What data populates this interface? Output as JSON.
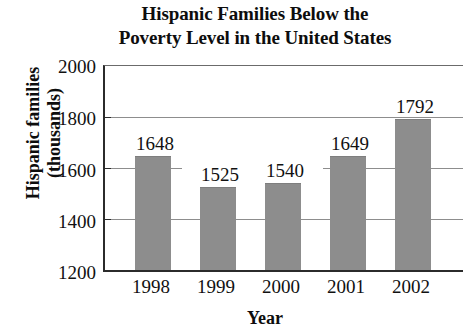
{
  "chart_data": {
    "type": "bar",
    "title": "Hispanic Families Below the Poverty Level in the United States",
    "title_lines": [
      "Hispanic Families Below the",
      "Poverty Level in the United States"
    ],
    "xlabel": "Year",
    "ylabel": "Hispanic families (thousands)",
    "ylabel_lines": [
      "Hispanic families",
      "(thousands)"
    ],
    "categories": [
      "1998",
      "1999",
      "2000",
      "2001",
      "2002"
    ],
    "values": [
      1648,
      1525,
      1540,
      1649,
      1792
    ],
    "value_labels": [
      "1648",
      "1525",
      "1540",
      "1649",
      "1792"
    ],
    "ylim": [
      1200,
      2000
    ],
    "ytick_labels": [
      "2000",
      "1800",
      "1600",
      "1400",
      "1200"
    ],
    "ytick_values": [
      2000,
      1800,
      1600,
      1400,
      1200
    ],
    "gridlines": [
      1800,
      1600,
      1400
    ],
    "grid": true,
    "legend": "none",
    "bar_color": "#8d8d8d",
    "axis_color": "#2b2b2b",
    "grid_color": "#8d8d8d",
    "text_color": "#111111",
    "background": "#ffffff"
  }
}
